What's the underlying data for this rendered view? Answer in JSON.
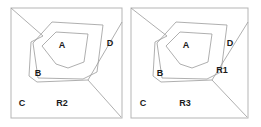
{
  "figure": {
    "title": "",
    "background_color": "#ffffff",
    "stroke_color": "#9a9a9a",
    "frame_color": "#b5b5b5",
    "text_color": "#1a1a1a",
    "panels": [
      {
        "id": "left-panel",
        "name": "panel-left",
        "frame": {
          "x": 11,
          "y": 8,
          "width": 111,
          "height": 110
        },
        "labels": [
          {
            "key": "A",
            "text": "A",
            "x": 62,
            "y": 48
          },
          {
            "key": "B",
            "text": "B",
            "x": 38,
            "y": 76
          },
          {
            "key": "C",
            "text": "C",
            "x": 22,
            "y": 106
          },
          {
            "key": "D",
            "text": "D",
            "x": 110,
            "y": 46
          },
          {
            "key": "R2",
            "text": "R2",
            "x": 62,
            "y": 106
          }
        ],
        "shapes": {
          "inner_region_A": "M 42,46 L 56,32 L 88,34 L 84,62 L 68,68 L 56,64 Z",
          "middle_region_B": "M 33,43 L 52,22 L 103,25 L 97,72 L 83,79 L 38,78 Z",
          "outer_boundary": "M 11,8 L 43,36 L 31,42 L 29,76 L 37,82 L 88,80 L 122,22",
          "diagonal_cut": "M 88,80 L 121,117"
        }
      },
      {
        "id": "right-panel",
        "name": "panel-right",
        "frame": {
          "x": 131,
          "y": 8,
          "width": 117,
          "height": 110
        },
        "labels": [
          {
            "key": "A",
            "text": "A",
            "x": 186,
            "y": 48
          },
          {
            "key": "B",
            "text": "B",
            "x": 160,
            "y": 76
          },
          {
            "key": "C",
            "text": "C",
            "x": 143,
            "y": 106
          },
          {
            "key": "D",
            "text": "D",
            "x": 230,
            "y": 46
          },
          {
            "key": "R1",
            "text": "R1",
            "x": 222,
            "y": 73
          },
          {
            "key": "R3",
            "text": "R3",
            "x": 185,
            "y": 106
          }
        ],
        "shapes": {
          "inner_region_A": "M 166,46 L 180,32 L 212,34 L 208,62 L 192,68 L 180,64 Z",
          "middle_region_B": "M 157,43 L 176,22 L 227,25 L 221,72 L 207,79 L 162,78 Z",
          "outer_boundary": "M 131,8 L 167,36 L 155,42 L 153,76 L 161,82 L 212,80 L 248,22",
          "diagonal_cut": "M 212,80 L 247,117"
        }
      }
    ],
    "legend_keys": [
      "A",
      "B",
      "C",
      "D",
      "R1",
      "R2",
      "R3"
    ]
  }
}
